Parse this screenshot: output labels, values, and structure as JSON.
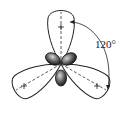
{
  "diagram": {
    "angle_label": "120°",
    "lobes": [
      {
        "name": "top",
        "direction_deg": 90,
        "sign": "+"
      },
      {
        "name": "lower-left",
        "direction_deg": 210,
        "sign": "+"
      },
      {
        "name": "lower-right",
        "direction_deg": 330,
        "sign": "+"
      }
    ],
    "colors": {
      "stroke": "#222222",
      "fill_small_lobes": "#555555",
      "background": "#ffffff"
    }
  }
}
